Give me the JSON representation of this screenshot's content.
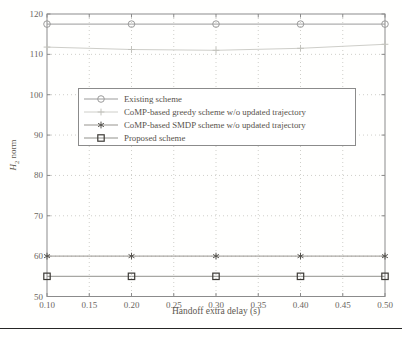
{
  "colors": {
    "background": "#fffffe",
    "axis": "#8b8b8b",
    "grid": "#cfcfca",
    "tick_text": "#6b665f",
    "label_text": "#5d5850",
    "legend_border": "#8b8b8b",
    "legend_bg": "#ffffff",
    "bottom_rule": "#4a4a4a"
  },
  "chart_data": {
    "type": "line",
    "title": "",
    "xlabel": "Handoff extra delay (s)",
    "ylabel": "H2 norm",
    "ylabel_parts": {
      "var": "H",
      "sub": "2",
      "rest": " norm"
    },
    "xlim": [
      0.1,
      0.5
    ],
    "ylim": [
      50,
      120
    ],
    "xtick_values": [
      0.1,
      0.15,
      0.2,
      0.25,
      0.3,
      0.35,
      0.4,
      0.45,
      0.5
    ],
    "xtick_labels": [
      "0.10",
      "0.15",
      "0.20",
      "0.25",
      "0.30",
      "0.35",
      "0.40",
      "0.45",
      "0.50"
    ],
    "ytick_values": [
      50,
      60,
      70,
      80,
      90,
      100,
      110,
      120
    ],
    "ytick_labels": [
      "50",
      "60",
      "70",
      "80",
      "90",
      "100",
      "110",
      "120"
    ],
    "grid": "dotted",
    "legend_position": "upper-left-inside",
    "x": [
      0.1,
      0.2,
      0.3,
      0.4,
      0.5
    ],
    "series": [
      {
        "name": "Existing scheme",
        "marker": "circle",
        "line_color": "#9b9b9b",
        "marker_color": "#9b9b9b",
        "y": [
          117.5,
          117.5,
          117.5,
          117.5,
          117.5
        ]
      },
      {
        "name": "CoMP-based greedy scheme w/o updated trajectory",
        "marker": "plus",
        "line_color": "#cecec9",
        "marker_color": "#c2c2bc",
        "y": [
          111.8,
          111.2,
          111.0,
          111.5,
          112.5
        ]
      },
      {
        "name": "CoMP-based SMDP scheme w/o updated trajectory",
        "marker": "asterisk",
        "line_color": "#97948f",
        "marker_color": "#55534e",
        "y": [
          60,
          60,
          60,
          60,
          60
        ]
      },
      {
        "name": "Proposed scheme",
        "marker": "square",
        "line_color": "#91918c",
        "marker_color": "#3c3a36",
        "y": [
          55,
          55,
          55,
          55,
          55
        ]
      }
    ]
  }
}
